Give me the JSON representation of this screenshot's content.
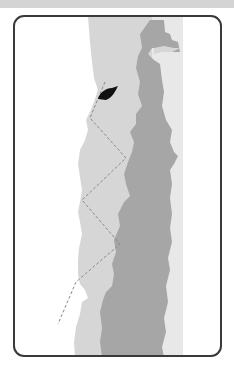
{
  "diagram": {
    "type": "coastline-map",
    "colors": {
      "water": "#ffffff",
      "shallow": "#d8d8d8",
      "land": "#a6a6a6",
      "strip": "#e8e8e8",
      "boat": "#111111",
      "path": "#8a8a8a",
      "frame": "#3a3a3a",
      "topbar": "#d4d4d4"
    },
    "elements": {
      "boat": {
        "label": "boat"
      },
      "path": {
        "label": "zigzag-route",
        "style": "dashed"
      }
    }
  }
}
